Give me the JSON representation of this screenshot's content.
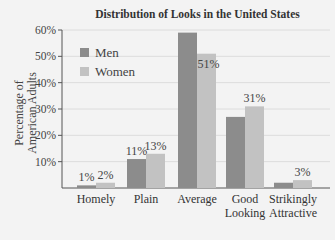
{
  "chart_data": {
    "type": "bar",
    "title": "Distribution of Looks in the United States",
    "xlabel": "",
    "ylabel": "Percentage of American Adults",
    "ylim": [
      0,
      60
    ],
    "yticks": [
      "10%",
      "20%",
      "30%",
      "40%",
      "50%",
      "60%"
    ],
    "grid": true,
    "legend_position": "upper-left",
    "categories": [
      "Homely",
      "Plain",
      "Average",
      "Good Looking",
      "Strikingly Attractive"
    ],
    "category_lines": [
      [
        "Homely"
      ],
      [
        "Plain"
      ],
      [
        "Average"
      ],
      [
        "Good",
        "Looking"
      ],
      [
        "Strikingly",
        "Attractive"
      ]
    ],
    "series": [
      {
        "name": "Men",
        "color": "#8c8c8c",
        "values": [
          1,
          11,
          59,
          27,
          2
        ],
        "labels": [
          "1%",
          "11%",
          "",
          "",
          ""
        ]
      },
      {
        "name": "Women",
        "color": "#c2c2c2",
        "values": [
          2,
          13,
          51,
          31,
          3
        ],
        "labels": [
          "2%",
          "13%",
          "51%",
          "31%",
          "3%"
        ]
      }
    ]
  },
  "labels": {
    "title": "Distribution of Looks in the United States",
    "ylabel_line1": "Percentage of",
    "ylabel_line2": "American Adults",
    "legend_men": "Men",
    "legend_women": "Women"
  }
}
